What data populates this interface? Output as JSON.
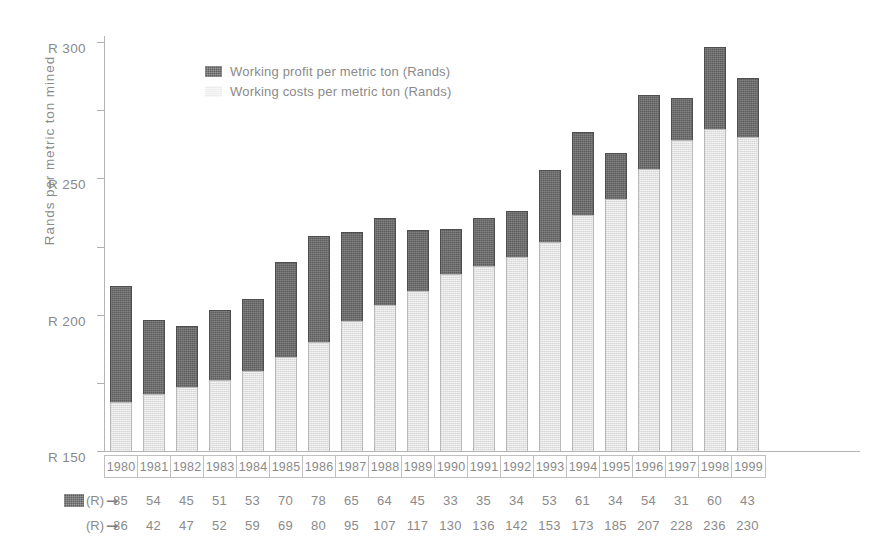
{
  "chart_data": {
    "type": "bar",
    "subtype": "stacked-bar",
    "title": "",
    "xlabel": "",
    "ylabel": "Rands per metric ton mined",
    "ylim": [
      0,
      300
    ],
    "ytick_values": [
      0,
      50,
      100,
      150,
      200,
      250,
      300
    ],
    "ytick_labels": [
      "0",
      "R 50",
      "R 100",
      "R 150",
      "R 200",
      "R 250",
      "R 300"
    ],
    "grid": false,
    "legend_position": "inside-top-left",
    "categories": [
      "1980",
      "1981",
      "1982",
      "1983",
      "1984",
      "1985",
      "1986",
      "1987",
      "1988",
      "1989",
      "1990",
      "1991",
      "1992",
      "1993",
      "1994",
      "1995",
      "1996",
      "1997",
      "1998",
      "1999"
    ],
    "series": [
      {
        "name": "Working costs per metric ton (Rands)",
        "stack_order": 1,
        "color": "#e3e3e3",
        "values": [
          36,
          42,
          47,
          52,
          59,
          69,
          80,
          95,
          107,
          117,
          130,
          136,
          142,
          153,
          173,
          185,
          207,
          228,
          236,
          230
        ]
      },
      {
        "name": "Working profit per metric ton (Rands)",
        "stack_order": 2,
        "color": "#5e5e5e",
        "values": [
          85,
          54,
          45,
          51,
          53,
          70,
          78,
          65,
          64,
          45,
          33,
          35,
          34,
          53,
          61,
          34,
          54,
          31,
          60,
          43
        ]
      }
    ],
    "totals": [
      121,
      96,
      92,
      103,
      112,
      139,
      158,
      160,
      171,
      162,
      163,
      171,
      176,
      206,
      234,
      219,
      261,
      259,
      296,
      273
    ]
  },
  "legend": {
    "items": [
      {
        "label": "Working profit per metric ton (Rands)",
        "swatch": "profit-swatch"
      },
      {
        "label": "Working costs per metric ton (Rands)",
        "swatch": "costs-swatch"
      }
    ]
  },
  "data_table": {
    "rows": [
      {
        "unit_label": "(R)",
        "arrow": "➞",
        "swatch": "profit-swatch",
        "values": [
          "85",
          "54",
          "45",
          "51",
          "53",
          "70",
          "78",
          "65",
          "64",
          "45",
          "33",
          "35",
          "34",
          "53",
          "61",
          "34",
          "54",
          "31",
          "60",
          "43"
        ]
      },
      {
        "unit_label": "(R)",
        "arrow": "➞",
        "swatch": "none",
        "values": [
          "36",
          "42",
          "47",
          "52",
          "59",
          "69",
          "80",
          "95",
          "107",
          "117",
          "130",
          "136",
          "142",
          "153",
          "173",
          "185",
          "207",
          "228",
          "236",
          "230"
        ]
      }
    ]
  },
  "colors": {
    "profit": "#5e5e5e",
    "costs": "#e3e3e3",
    "axis": "#b4b4b4",
    "text": "#8a8a8a",
    "background": "#ffffff"
  }
}
